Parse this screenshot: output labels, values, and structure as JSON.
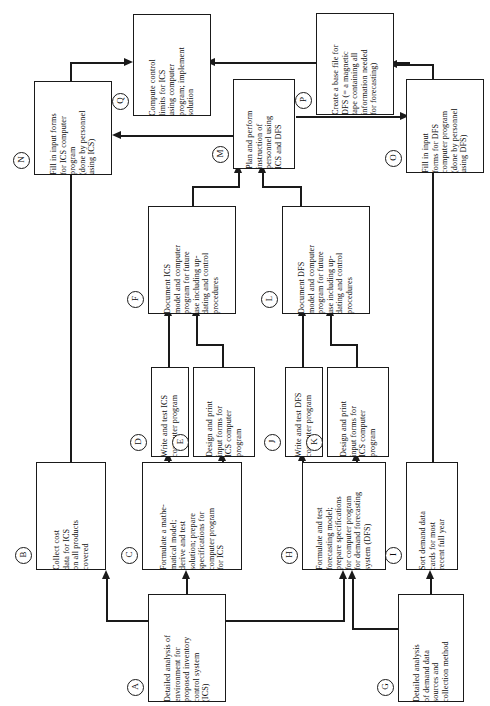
{
  "diagram": {
    "orientation": "rotated-90-ccw",
    "nodes": [
      {
        "id": "A",
        "tag": "A",
        "text": "Detailed analysis of\nenvironment for\nproposed inventory\ncontrol system\n(ICS)",
        "x": 148,
        "y": 594,
        "w": 78,
        "h": 108,
        "fontsize": 8.2
      },
      {
        "id": "B",
        "tag": "B",
        "text": "Collect cost\ndata for ICS\non all products\ncovered",
        "x": 36,
        "y": 462,
        "w": 70,
        "h": 108,
        "fontsize": 8.2
      },
      {
        "id": "C",
        "tag": "C",
        "text": "Formulate a mathe-\nmatical model;\nderive and test\nsolution; prepare\nspecifications for\ncomputer program\nfor ICS",
        "x": 142,
        "y": 462,
        "w": 100,
        "h": 108,
        "fontsize": 8.2
      },
      {
        "id": "D",
        "tag": "D",
        "text": "Write and test ICS\ncomputer program",
        "x": 151,
        "y": 367,
        "w": 38,
        "h": 90,
        "fontsize": 8.2
      },
      {
        "id": "E",
        "tag": "E",
        "text": "Design and print\ninput forms for\nICS computer\nprogram",
        "x": 193,
        "y": 367,
        "w": 62,
        "h": 90,
        "fontsize": 8.2
      },
      {
        "id": "F",
        "tag": "F",
        "text": "Document ICS\nmodel and computer\nprogram for future\nuse including up-\ndating and control\nprocedures",
        "x": 148,
        "y": 206,
        "w": 88,
        "h": 108,
        "fontsize": 8.2
      },
      {
        "id": "G",
        "tag": "G",
        "text": "Detailed analysis\nof demand data\nsources and\ncollection method",
        "x": 398,
        "y": 594,
        "w": 66,
        "h": 108,
        "fontsize": 8.2
      },
      {
        "id": "H",
        "tag": "H",
        "text": "Formulate and test\nforecasting model;\nprepare specifications\nfor computer program\nfor demand forecasting\nsystem (DFS)",
        "x": 302,
        "y": 462,
        "w": 84,
        "h": 108,
        "fontsize": 8.2
      },
      {
        "id": "I",
        "tag": "I",
        "text": "Sort demand data\ncards for most\nrecent full year",
        "x": 406,
        "y": 462,
        "w": 52,
        "h": 108,
        "fontsize": 8.2
      },
      {
        "id": "J",
        "tag": "J",
        "text": "Write and test DFS\ncomputer program",
        "x": 285,
        "y": 367,
        "w": 38,
        "h": 90,
        "fontsize": 8.2
      },
      {
        "id": "K",
        "tag": "K",
        "text": "Design and print\ninput forms for\nICS computer\nprogram",
        "x": 327,
        "y": 367,
        "w": 62,
        "h": 90,
        "fontsize": 8.2
      },
      {
        "id": "L",
        "tag": "L",
        "text": "Document DFS\nmodel and computer\nprogram for future\nuse including up-\ndating and control\nprocedures",
        "x": 282,
        "y": 206,
        "w": 88,
        "h": 108,
        "fontsize": 8.2
      },
      {
        "id": "M",
        "tag": "M",
        "text": "Plan and perform\ninstruction of\npersonnel using\nICS and DFS",
        "x": 233,
        "y": 79,
        "w": 62,
        "h": 90,
        "fontsize": 8.2
      },
      {
        "id": "N",
        "tag": "N",
        "text": "Fill in input forms\nfor ICS computer\nprogram\n(done by personnel\nusing ICS)",
        "x": 34,
        "y": 81,
        "w": 78,
        "h": 94,
        "fontsize": 8.2
      },
      {
        "id": "O",
        "tag": "O",
        "text": "Fill in input\nforms for DFS\ncomputer program\n(done by personnel\nusing DFS)",
        "x": 406,
        "y": 79,
        "w": 78,
        "h": 94,
        "fontsize": 8.2
      },
      {
        "id": "P",
        "tag": "P",
        "text": "Create a base file for\nDFS (= a magnetic\ntape containing all\ninformation needed\nfor forecasting)",
        "x": 316,
        "y": 13,
        "w": 78,
        "h": 102,
        "fontsize": 8.2
      },
      {
        "id": "Q",
        "tag": "Q",
        "text": "Compute control\nlimits for ICS\nusing computer\nprogram; implement\nsolution",
        "x": 133,
        "y": 14,
        "w": 78,
        "h": 102,
        "fontsize": 8.2
      }
    ],
    "edges": [
      {
        "from": "A",
        "to": "B"
      },
      {
        "from": "A",
        "to": "C"
      },
      {
        "from": "A",
        "to": "H"
      },
      {
        "from": "B",
        "to": "Q"
      },
      {
        "from": "C",
        "to": "D"
      },
      {
        "from": "C",
        "to": "E"
      },
      {
        "from": "D",
        "to": "F"
      },
      {
        "from": "E",
        "to": "F"
      },
      {
        "from": "F",
        "to": "M"
      },
      {
        "from": "G",
        "to": "H"
      },
      {
        "from": "G",
        "to": "I"
      },
      {
        "from": "H",
        "to": "J"
      },
      {
        "from": "H",
        "to": "K"
      },
      {
        "from": "I",
        "to": "P"
      },
      {
        "from": "J",
        "to": "L"
      },
      {
        "from": "K",
        "to": "L"
      },
      {
        "from": "L",
        "to": "M"
      },
      {
        "from": "M",
        "to": "N"
      },
      {
        "from": "M",
        "to": "O"
      },
      {
        "from": "P",
        "to": "O"
      },
      {
        "from": "O",
        "to": "Q"
      },
      {
        "from": "N",
        "to": "Q"
      }
    ]
  }
}
